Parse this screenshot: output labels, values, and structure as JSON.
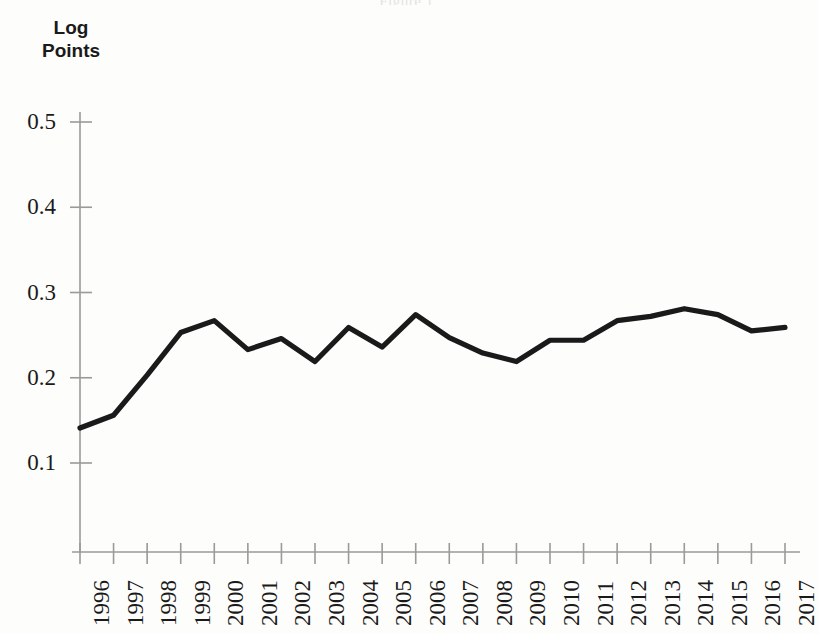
{
  "page": {
    "background_color": "#fdfdfb",
    "title_remnant": "Figure 1"
  },
  "axis": {
    "y_title_line1": "Log",
    "y_title_line2": "Points",
    "y_ticks": [
      "0.1",
      "0.2",
      "0.3",
      "0.4",
      "0.5"
    ],
    "x_ticks": [
      "1996",
      "1997",
      "1998",
      "1999",
      "2000",
      "2001",
      "2002",
      "2003",
      "2004",
      "2005",
      "2006",
      "2007",
      "2008",
      "2009",
      "2010",
      "2011",
      "2012",
      "2013",
      "2014",
      "2015",
      "2016",
      "2017"
    ],
    "line_color": "#1a1a1a",
    "axis_color": "#9a9a9a"
  },
  "chart_data": {
    "type": "line",
    "title": "",
    "xlabel": "",
    "ylabel": "Log Points",
    "ylim": [
      0.0,
      0.55
    ],
    "yticks": [
      0.1,
      0.2,
      0.3,
      0.4,
      0.5
    ],
    "grid": false,
    "legend": "none",
    "x": [
      1996,
      1997,
      1998,
      1999,
      2000,
      2001,
      2002,
      2003,
      2004,
      2005,
      2006,
      2007,
      2008,
      2009,
      2010,
      2011,
      2012,
      2013,
      2014,
      2015,
      2016,
      2017
    ],
    "categories": [
      "1996",
      "1997",
      "1998",
      "1999",
      "2000",
      "2001",
      "2002",
      "2003",
      "2004",
      "2005",
      "2006",
      "2007",
      "2008",
      "2009",
      "2010",
      "2011",
      "2012",
      "2013",
      "2014",
      "2015",
      "2016",
      "2017"
    ],
    "series": [
      {
        "name": "Log Points",
        "values": [
          0.141,
          0.156,
          0.203,
          0.253,
          0.267,
          0.233,
          0.246,
          0.219,
          0.259,
          0.236,
          0.274,
          0.247,
          0.229,
          0.219,
          0.244,
          0.244,
          0.267,
          0.272,
          0.281,
          0.274,
          0.255,
          0.259
        ]
      }
    ],
    "values": [
      0.141,
      0.156,
      0.203,
      0.253,
      0.267,
      0.233,
      0.246,
      0.219,
      0.259,
      0.236,
      0.274,
      0.247,
      0.229,
      0.219,
      0.244,
      0.244,
      0.267,
      0.272,
      0.281,
      0.274,
      0.255,
      0.259
    ]
  }
}
